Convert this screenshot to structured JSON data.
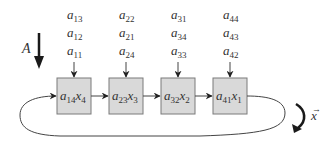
{
  "diagram": {
    "matrix_label": "A",
    "vector_label": "x",
    "vector_accent": "→",
    "colors": {
      "box_fill": "#d9d9d9",
      "box_stroke": "#7a7a7a",
      "text": "#333333",
      "arrow": "#222222"
    },
    "cells": [
      {
        "a": "a",
        "a_sub": "14",
        "x": "x",
        "x_sub": "4",
        "inputs": [
          {
            "base": "a",
            "sub": "13"
          },
          {
            "base": "a",
            "sub": "12"
          },
          {
            "base": "a",
            "sub": "11"
          }
        ]
      },
      {
        "a": "a",
        "a_sub": "23",
        "x": "x",
        "x_sub": "3",
        "inputs": [
          {
            "base": "a",
            "sub": "22"
          },
          {
            "base": "a",
            "sub": "21"
          },
          {
            "base": "a",
            "sub": "24"
          }
        ]
      },
      {
        "a": "a",
        "a_sub": "32",
        "x": "x",
        "x_sub": "2",
        "inputs": [
          {
            "base": "a",
            "sub": "31"
          },
          {
            "base": "a",
            "sub": "34"
          },
          {
            "base": "a",
            "sub": "33"
          }
        ]
      },
      {
        "a": "a",
        "a_sub": "41",
        "x": "x",
        "x_sub": "1",
        "inputs": [
          {
            "base": "a",
            "sub": "44"
          },
          {
            "base": "a",
            "sub": "43"
          },
          {
            "base": "a",
            "sub": "42"
          }
        ]
      }
    ]
  }
}
